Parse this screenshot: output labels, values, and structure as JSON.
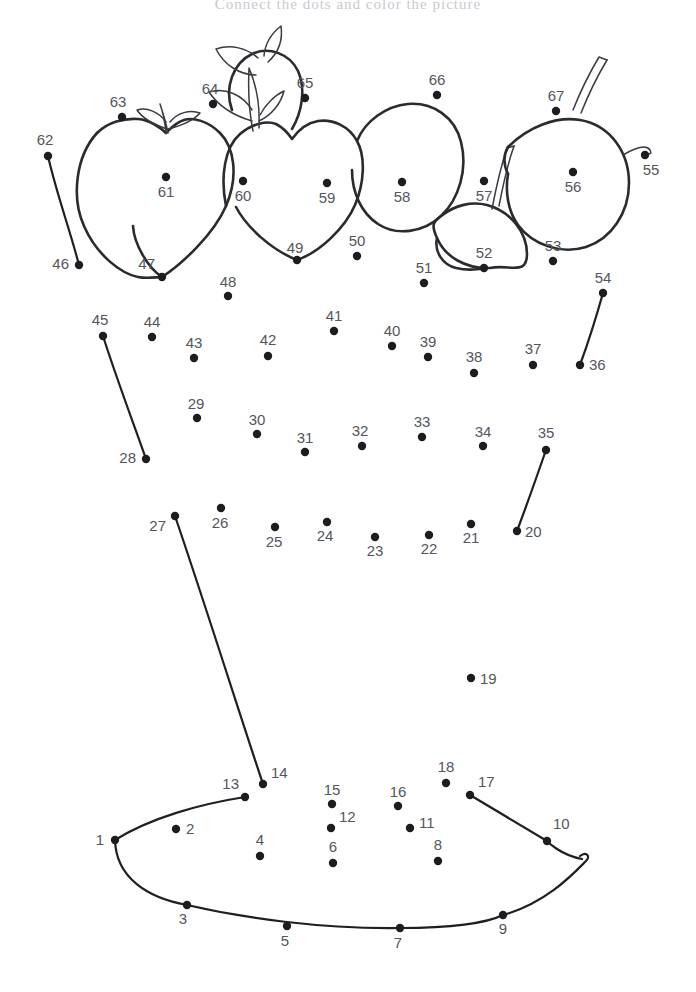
{
  "page": {
    "title": "Connect the dots and color the picture",
    "title_color": "#c9c9cf",
    "background_color": "#ffffff",
    "width": 696,
    "height": 992,
    "dot_color": "#1d1d21",
    "label_color": "#55555c",
    "outline_color": "#2b2b2f"
  },
  "puzzle": {
    "kind": "connect-the-dots",
    "subject": "basket of fruit",
    "dot_count": 67,
    "dots": [
      {
        "n": "1",
        "x": 115,
        "y": 840,
        "lx": 104,
        "ly": 845,
        "anchor": "end"
      },
      {
        "n": "2",
        "x": 176,
        "y": 829,
        "lx": 186,
        "ly": 834,
        "anchor": "start"
      },
      {
        "n": "3",
        "x": 187,
        "y": 905,
        "lx": 183,
        "ly": 924,
        "anchor": "middle"
      },
      {
        "n": "4",
        "x": 260,
        "y": 856,
        "lx": 260,
        "ly": 845,
        "anchor": "middle"
      },
      {
        "n": "5",
        "x": 287,
        "y": 926,
        "lx": 285,
        "ly": 946,
        "anchor": "middle"
      },
      {
        "n": "6",
        "x": 333,
        "y": 863,
        "lx": 333,
        "ly": 852,
        "anchor": "middle"
      },
      {
        "n": "7",
        "x": 400,
        "y": 928,
        "lx": 398,
        "ly": 948,
        "anchor": "middle"
      },
      {
        "n": "8",
        "x": 438,
        "y": 861,
        "lx": 438,
        "ly": 850,
        "anchor": "middle"
      },
      {
        "n": "9",
        "x": 503,
        "y": 915,
        "lx": 503,
        "ly": 934,
        "anchor": "middle"
      },
      {
        "n": "10",
        "x": 547,
        "y": 841,
        "lx": 553,
        "ly": 829,
        "anchor": "start"
      },
      {
        "n": "11",
        "x": 410,
        "y": 828,
        "lx": 419,
        "ly": 828,
        "anchor": "start"
      },
      {
        "n": "12",
        "x": 331,
        "y": 828,
        "lx": 339,
        "ly": 822,
        "anchor": "start"
      },
      {
        "n": "13",
        "x": 245,
        "y": 797,
        "lx": 239,
        "ly": 789,
        "anchor": "end"
      },
      {
        "n": "14",
        "x": 263,
        "y": 784,
        "lx": 271,
        "ly": 778,
        "anchor": "start"
      },
      {
        "n": "15",
        "x": 332,
        "y": 804,
        "lx": 332,
        "ly": 795,
        "anchor": "middle"
      },
      {
        "n": "16",
        "x": 398,
        "y": 806,
        "lx": 398,
        "ly": 797,
        "anchor": "middle"
      },
      {
        "n": "17",
        "x": 470,
        "y": 795,
        "lx": 478,
        "ly": 787,
        "anchor": "start"
      },
      {
        "n": "18",
        "x": 446,
        "y": 783,
        "lx": 446,
        "ly": 772,
        "anchor": "middle"
      },
      {
        "n": "19",
        "x": 471,
        "y": 678,
        "lx": 480,
        "ly": 684,
        "anchor": "start"
      },
      {
        "n": "20",
        "x": 517,
        "y": 531,
        "lx": 525,
        "ly": 537,
        "anchor": "start"
      },
      {
        "n": "21",
        "x": 471,
        "y": 524,
        "lx": 471,
        "ly": 543,
        "anchor": "middle"
      },
      {
        "n": "22",
        "x": 429,
        "y": 535,
        "lx": 429,
        "ly": 554,
        "anchor": "middle"
      },
      {
        "n": "23",
        "x": 375,
        "y": 537,
        "lx": 375,
        "ly": 556,
        "anchor": "middle"
      },
      {
        "n": "24",
        "x": 327,
        "y": 522,
        "lx": 325,
        "ly": 541,
        "anchor": "middle"
      },
      {
        "n": "25",
        "x": 275,
        "y": 527,
        "lx": 274,
        "ly": 547,
        "anchor": "middle"
      },
      {
        "n": "26",
        "x": 221,
        "y": 508,
        "lx": 220,
        "ly": 528,
        "anchor": "middle"
      },
      {
        "n": "27",
        "x": 175,
        "y": 516,
        "lx": 166,
        "ly": 531,
        "anchor": "end"
      },
      {
        "n": "28",
        "x": 146,
        "y": 459,
        "lx": 136,
        "ly": 463,
        "anchor": "end"
      },
      {
        "n": "29",
        "x": 197,
        "y": 418,
        "lx": 196,
        "ly": 409,
        "anchor": "middle"
      },
      {
        "n": "30",
        "x": 257,
        "y": 434,
        "lx": 257,
        "ly": 425,
        "anchor": "middle"
      },
      {
        "n": "31",
        "x": 305,
        "y": 452,
        "lx": 305,
        "ly": 443,
        "anchor": "middle"
      },
      {
        "n": "32",
        "x": 362,
        "y": 446,
        "lx": 360,
        "ly": 436,
        "anchor": "middle"
      },
      {
        "n": "33",
        "x": 422,
        "y": 437,
        "lx": 422,
        "ly": 427,
        "anchor": "middle"
      },
      {
        "n": "34",
        "x": 483,
        "y": 446,
        "lx": 483,
        "ly": 437,
        "anchor": "middle"
      },
      {
        "n": "35",
        "x": 546,
        "y": 450,
        "lx": 546,
        "ly": 438,
        "anchor": "middle"
      },
      {
        "n": "36",
        "x": 580,
        "y": 365,
        "lx": 589,
        "ly": 370,
        "anchor": "start"
      },
      {
        "n": "37",
        "x": 533,
        "y": 365,
        "lx": 533,
        "ly": 354,
        "anchor": "middle"
      },
      {
        "n": "38",
        "x": 474,
        "y": 373,
        "lx": 474,
        "ly": 362,
        "anchor": "middle"
      },
      {
        "n": "39",
        "x": 428,
        "y": 357,
        "lx": 428,
        "ly": 347,
        "anchor": "middle"
      },
      {
        "n": "40",
        "x": 392,
        "y": 346,
        "lx": 392,
        "ly": 336,
        "anchor": "middle"
      },
      {
        "n": "41",
        "x": 334,
        "y": 331,
        "lx": 334,
        "ly": 321,
        "anchor": "middle"
      },
      {
        "n": "42",
        "x": 268,
        "y": 356,
        "lx": 268,
        "ly": 345,
        "anchor": "middle"
      },
      {
        "n": "43",
        "x": 194,
        "y": 358,
        "lx": 194,
        "ly": 348,
        "anchor": "middle"
      },
      {
        "n": "44",
        "x": 152,
        "y": 337,
        "lx": 152,
        "ly": 327,
        "anchor": "middle"
      },
      {
        "n": "45",
        "x": 103,
        "y": 336,
        "lx": 100,
        "ly": 325,
        "anchor": "middle"
      },
      {
        "n": "46",
        "x": 79,
        "y": 265,
        "lx": 69,
        "ly": 269,
        "anchor": "end"
      },
      {
        "n": "47",
        "x": 162,
        "y": 277,
        "lx": 155,
        "ly": 269,
        "anchor": "end"
      },
      {
        "n": "48",
        "x": 228,
        "y": 296,
        "lx": 228,
        "ly": 287,
        "anchor": "middle"
      },
      {
        "n": "49",
        "x": 297,
        "y": 260,
        "lx": 295,
        "ly": 253,
        "anchor": "middle"
      },
      {
        "n": "50",
        "x": 357,
        "y": 256,
        "lx": 357,
        "ly": 246,
        "anchor": "middle"
      },
      {
        "n": "51",
        "x": 424,
        "y": 283,
        "lx": 424,
        "ly": 273,
        "anchor": "middle"
      },
      {
        "n": "52",
        "x": 484,
        "y": 268,
        "lx": 484,
        "ly": 258,
        "anchor": "middle"
      },
      {
        "n": "53",
        "x": 553,
        "y": 261,
        "lx": 553,
        "ly": 251,
        "anchor": "middle"
      },
      {
        "n": "54",
        "x": 603,
        "y": 293,
        "lx": 603,
        "ly": 283,
        "anchor": "middle"
      },
      {
        "n": "55",
        "x": 645,
        "y": 155,
        "lx": 651,
        "ly": 175,
        "anchor": "middle"
      },
      {
        "n": "56",
        "x": 573,
        "y": 172,
        "lx": 573,
        "ly": 192,
        "anchor": "middle"
      },
      {
        "n": "57",
        "x": 484,
        "y": 181,
        "lx": 484,
        "ly": 201,
        "anchor": "middle"
      },
      {
        "n": "58",
        "x": 402,
        "y": 182,
        "lx": 402,
        "ly": 202,
        "anchor": "middle"
      },
      {
        "n": "59",
        "x": 327,
        "y": 183,
        "lx": 327,
        "ly": 203,
        "anchor": "middle"
      },
      {
        "n": "60",
        "x": 243,
        "y": 181,
        "lx": 243,
        "ly": 201,
        "anchor": "middle"
      },
      {
        "n": "61",
        "x": 166,
        "y": 177,
        "lx": 166,
        "ly": 197,
        "anchor": "middle"
      },
      {
        "n": "62",
        "x": 48,
        "y": 156,
        "lx": 45,
        "ly": 145,
        "anchor": "middle"
      },
      {
        "n": "63",
        "x": 122,
        "y": 117,
        "lx": 118,
        "ly": 107,
        "anchor": "middle"
      },
      {
        "n": "64",
        "x": 213,
        "y": 104,
        "lx": 210,
        "ly": 94,
        "anchor": "middle"
      },
      {
        "n": "65",
        "x": 305,
        "y": 98,
        "lx": 305,
        "ly": 88,
        "anchor": "middle"
      },
      {
        "n": "66",
        "x": 437,
        "y": 95,
        "lx": 437,
        "ly": 85,
        "anchor": "middle"
      },
      {
        "n": "67",
        "x": 556,
        "y": 111,
        "lx": 556,
        "ly": 101,
        "anchor": "middle"
      }
    ],
    "segments": [
      {
        "from": "62",
        "to": "46",
        "d": "M48,156 C56,192 70,230 79,265"
      },
      {
        "from": "45",
        "to": "28",
        "d": "M103,336 C116,377 133,422 146,459"
      },
      {
        "from": "54",
        "to": "36",
        "d": "M603,293 C596,318 588,343 580,365"
      },
      {
        "from": "35",
        "to": "20",
        "d": "M546,450 C537,476 526,507 517,531"
      },
      {
        "from": "27",
        "to": "14",
        "d": "M175,516 C205,604 237,706 263,784"
      },
      {
        "from": "13",
        "to": "1",
        "d": "M245,797 C200,804 150,818 115,840"
      },
      {
        "from": "1",
        "to": "9",
        "d": "M115,840 C116,878 148,898 187,905 C243,918 320,929 400,928 C450,928 487,923 503,915"
      },
      {
        "from": "9",
        "to": "10",
        "d": "M503,915 C547,903 575,872 586,861 C591,856 586,851 580,856"
      },
      {
        "from": "10",
        "to": "17",
        "d": "M547,841 C547,841 560,855 582,859 M547,841 L470,795"
      }
    ],
    "fruit_outlines": [
      {
        "name": "strawberry-left-body",
        "d": "M97,133 C76,156 71,197 84,226 C97,256 122,274 138,277 C147,279 156,277 162,277 C148,268 134,244 133,226"
      },
      {
        "name": "strawberry-left-body-right",
        "d": "M162,277 C182,264 214,234 226,206 C239,176 234,147 220,133 C208,121 193,117 184,120 C175,123 171,128 166,133 C161,128 150,120 138,119 C124,118 108,122 97,133"
      },
      {
        "name": "strawberry-left-leaf-center",
        "d": "M166,133 C165,123 163,112 160,104 C163,113 166,122 168,133"
      },
      {
        "name": "strawberry-left-leaf-l",
        "d": "M167,129 C155,125 143,119 137,110 C147,107 159,112 166,122"
      },
      {
        "name": "strawberry-left-leaf-r",
        "d": "M168,129 C180,126 193,121 200,113 C190,109 177,113 170,122"
      },
      {
        "name": "strawberry-mid-body",
        "d": "M226,206 C220,176 225,147 240,134 C252,124 267,120 276,124 C284,128 288,133 292,139 C297,132 306,123 318,121 C333,119 349,126 357,141 C366,157 364,184 355,205 C345,228 320,252 297,260 C272,250 247,228 236,207"
      },
      {
        "name": "strawberry-mid-stem",
        "d": "M253,131 C249,112 248,90 249,68 C256,84 260,106 259,128"
      },
      {
        "name": "strawberry-mid-leaf-l",
        "d": "M252,121 C235,116 219,107 209,92 C225,87 243,95 252,110"
      },
      {
        "name": "strawberry-mid-leaf-r",
        "d": "M259,121 C272,115 281,103 284,91 C275,95 265,105 260,115"
      },
      {
        "name": "apple-top-small",
        "d": "M232,110 C224,88 233,63 252,54 C269,46 290,54 298,71 C306,89 302,112 292,129"
      },
      {
        "name": "apple-top-small-leaf",
        "d": "M258,58 C247,48 231,44 216,49 C224,65 240,75 256,75"
      },
      {
        "name": "apple-top-small-leaf2",
        "d": "M264,56 C265,44 272,33 281,26 C283,40 278,53 268,62"
      },
      {
        "name": "pear-58-body",
        "d": "M357,141 C365,121 386,106 408,104 C433,102 455,117 461,142 C468,169 459,199 441,216 C423,233 396,236 378,224 C361,213 352,192 352,170"
      },
      {
        "name": "apple-57-body",
        "d": "M441,216 C455,205 472,201 487,205 C510,211 527,232 527,254 C527,276 510,264 490,268 C466,269 445,257 437,238 C431,225 433,222 441,216"
      },
      {
        "name": "apple-57-body-lower",
        "d": "M437,238 C434,252 443,265 456,268 C469,271 481,269 484,268"
      },
      {
        "name": "apple-57-stem-out",
        "d": "M499,206 C503,185 508,163 514,146"
      },
      {
        "name": "apple-57-stem-in",
        "d": "M492,209 C496,188 501,166 507,148 L514,146"
      },
      {
        "name": "apple-56-body",
        "d": "M508,147 C528,127 556,116 580,120 C610,125 629,152 629,183 C629,213 611,239 586,247 C560,255 532,244 518,225 C508,211 505,192 508,174"
      },
      {
        "name": "apple-56-body-l",
        "d": "M508,174 C503,164 504,154 508,147"
      },
      {
        "name": "apple-56-stem-out",
        "d": "M581,113 C589,93 598,75 607,60"
      },
      {
        "name": "apple-56-stem-in",
        "d": "M573,110 C581,90 590,72 599,57 L607,60"
      },
      {
        "name": "apple-56-leaf-curl",
        "d": "M623,155 C635,148 646,144 650,150 C653,156 648,152 645,155"
      }
    ]
  }
}
